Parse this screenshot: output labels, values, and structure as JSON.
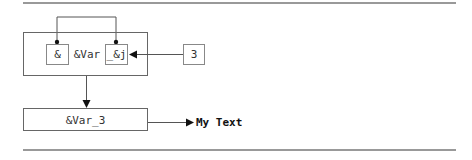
{
  "diagram": {
    "outer_box": {
      "left_operand": "&",
      "middle_text": "&Var",
      "right_operand": "_&j"
    },
    "input_value": "3",
    "result_box": "&Var_3",
    "output_label": "My Text"
  },
  "colors": {
    "line": "#555555",
    "rule": "#777777",
    "text": "#333333",
    "background": "#ffffff"
  }
}
